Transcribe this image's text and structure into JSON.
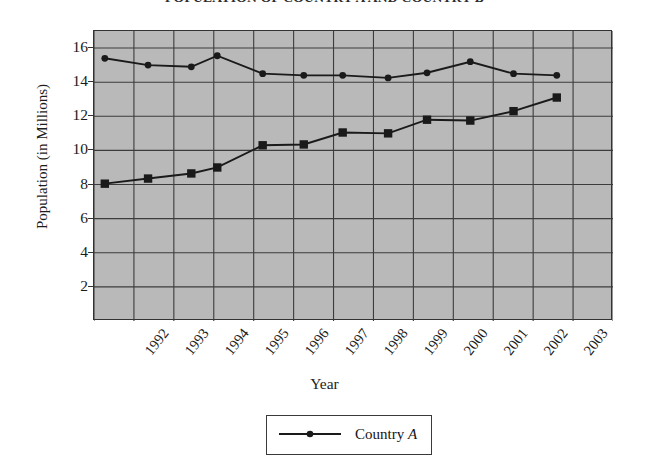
{
  "chart_data": {
    "type": "line",
    "title": "POPULATION OF COUNTRY A AND COUNTRY B",
    "xlabel": "Year",
    "ylabel": "Population (in Millions)",
    "categories": [
      "1992",
      "1993",
      "1994",
      "1995",
      "1996",
      "1997",
      "1998",
      "1999",
      "2000",
      "2001",
      "2002",
      "2003"
    ],
    "x_tick_labels": [
      "1992",
      "1993",
      "1994",
      "1995",
      "1996",
      "1997",
      "1998",
      "1999",
      "2000",
      "2001",
      "2002",
      "2003"
    ],
    "y_tick_labels": [
      "16",
      "14",
      "12",
      "10",
      "8",
      "6",
      "4",
      "2"
    ],
    "y_tick_values": [
      16,
      14,
      12,
      10,
      8,
      6,
      4,
      2
    ],
    "ylim": [
      0,
      17
    ],
    "xlim": [
      1991.6,
      2003.6
    ],
    "grid": true,
    "plot_background": "#b9b9b9",
    "legend_position": "bottom-center",
    "series": [
      {
        "name": "Country A",
        "marker": "circle",
        "color": "#1a1a1a",
        "x": [
          1991.85,
          1992.85,
          1993.85,
          1994.45,
          1995.5,
          1996.45,
          1997.35,
          1998.4,
          1999.3,
          2000.3,
          2001.3,
          2002.3
        ],
        "values": [
          15.4,
          15.0,
          14.9,
          15.55,
          14.5,
          14.4,
          14.4,
          14.25,
          14.55,
          15.2,
          14.5,
          14.4
        ]
      },
      {
        "name": "Country B",
        "marker": "square",
        "color": "#1a1a1a",
        "x": [
          1991.85,
          1992.85,
          1993.85,
          1994.45,
          1995.5,
          1996.45,
          1997.35,
          1998.4,
          1999.3,
          2000.3,
          2001.3,
          2002.3
        ],
        "values": [
          8.05,
          8.35,
          8.65,
          9.0,
          10.3,
          10.35,
          11.05,
          11.0,
          11.8,
          11.75,
          12.3,
          13.1
        ]
      }
    ]
  },
  "legend": {
    "entries": [
      {
        "label_prefix": "Country ",
        "label_suffix": "A"
      }
    ]
  }
}
